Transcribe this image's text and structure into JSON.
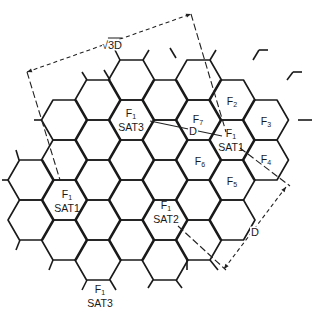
{
  "diagram": {
    "grid": {
      "origin_x": 198.5,
      "origin_y": 80,
      "col_spacing": 33.5,
      "row_spacing": 40,
      "side": 23,
      "cells": [
        {
          "k": -5,
          "y": 180
        },
        {
          "k": -5,
          "y": 220
        },
        {
          "k": -4,
          "y": 120
        },
        {
          "k": -4,
          "y": 160
        },
        {
          "k": -4,
          "y": 200
        },
        {
          "k": -4,
          "y": 240
        },
        {
          "k": -3,
          "y": 100
        },
        {
          "k": -3,
          "y": 140
        },
        {
          "k": -3,
          "y": 180
        },
        {
          "k": -3,
          "y": 220
        },
        {
          "k": -3,
          "y": 260
        },
        {
          "k": -2,
          "y": 80
        },
        {
          "k": -2,
          "y": 120
        },
        {
          "k": -2,
          "y": 160
        },
        {
          "k": -2,
          "y": 200
        },
        {
          "k": -2,
          "y": 240
        },
        {
          "k": -1,
          "y": 100
        },
        {
          "k": -1,
          "y": 140
        },
        {
          "k": -1,
          "y": 180
        },
        {
          "k": -1,
          "y": 220
        },
        {
          "k": -1,
          "y": 260
        },
        {
          "k": 0,
          "y": 80
        },
        {
          "k": 0,
          "y": 120
        },
        {
          "k": 0,
          "y": 160
        },
        {
          "k": 0,
          "y": 200
        },
        {
          "k": 0,
          "y": 240
        },
        {
          "k": 1,
          "y": 100
        },
        {
          "k": 1,
          "y": 140
        },
        {
          "k": 1,
          "y": 180
        },
        {
          "k": 1,
          "y": 220
        },
        {
          "k": 2,
          "y": 120
        },
        {
          "k": 2,
          "y": 160
        }
      ],
      "stubs": [
        [
          176,
          58,
          170,
          48
        ],
        [
          210,
          60,
          216,
          50
        ],
        [
          143,
          60,
          149,
          50
        ],
        [
          120,
          60,
          115,
          50
        ],
        [
          110,
          80,
          104,
          70
        ],
        [
          87,
          80,
          82,
          72
        ],
        [
          253,
          60,
          259,
          50
        ],
        [
          259,
          50,
          268,
          50
        ],
        [
          287,
          80,
          293,
          72
        ],
        [
          293,
          72,
          302,
          72
        ],
        [
          298,
          120,
          312,
          120
        ],
        [
          42,
          120,
          34,
          120
        ],
        [
          8,
          180,
          2,
          180
        ],
        [
          19,
          160,
          16,
          150
        ],
        [
          20,
          240,
          16,
          250
        ],
        [
          53,
          260,
          49,
          270
        ],
        [
          87,
          280,
          82,
          290
        ],
        [
          110,
          280,
          116,
          290
        ],
        [
          153,
          280,
          148,
          288
        ],
        [
          176,
          280,
          182,
          288
        ],
        [
          187,
          260,
          187,
          270
        ],
        [
          210,
          260,
          218,
          270
        ]
      ]
    },
    "cell_labels": [
      {
        "id": "f1-sat3-upper",
        "freq": "F",
        "sub": "1",
        "sat": "SAT3",
        "x": 131,
        "y": 120
      },
      {
        "id": "f7",
        "freq": "F",
        "sub": "7",
        "sat": "",
        "x": 198,
        "y": 120
      },
      {
        "id": "f2",
        "freq": "F",
        "sub": "2",
        "sat": "",
        "x": 232,
        "y": 102
      },
      {
        "id": "f3",
        "freq": "F",
        "sub": "3",
        "sat": "",
        "x": 266,
        "y": 122
      },
      {
        "id": "f1-sat1-right",
        "freq": "F",
        "sub": "1",
        "sat": "SAT1",
        "x": 231,
        "y": 140
      },
      {
        "id": "f4",
        "freq": "F",
        "sub": "4",
        "sat": "",
        "x": 266,
        "y": 160
      },
      {
        "id": "f6",
        "freq": "F",
        "sub": "6",
        "sat": "",
        "x": 200,
        "y": 162
      },
      {
        "id": "f5",
        "freq": "F",
        "sub": "5",
        "sat": "",
        "x": 232,
        "y": 182
      },
      {
        "id": "f1-sat1-left",
        "freq": "F",
        "sub": "1",
        "sat": "SAT1",
        "x": 67,
        "y": 201
      },
      {
        "id": "f1-sat2",
        "freq": "F",
        "sub": "1",
        "sat": "SAT2",
        "x": 166,
        "y": 212
      },
      {
        "id": "f1-sat3-lower",
        "freq": "F",
        "sub": "1",
        "sat": "SAT3",
        "x": 100,
        "y": 296
      }
    ],
    "dimensions": {
      "sqrt3d": {
        "radical": "√",
        "label": "3D",
        "x": 112,
        "y": 45
      },
      "d_center": {
        "label": "D",
        "x": 193,
        "y": 131
      },
      "d_side": {
        "label": "D",
        "x": 255,
        "y": 232
      }
    },
    "lines": {
      "sqrt3d_top": [
        27,
        72,
        191,
        14
      ],
      "sqrt3d_left_ext": [
        27,
        72,
        60,
        180
      ],
      "sqrt3d_right_ext": [
        191,
        14,
        226,
        132
      ],
      "d_center_line": [
        150,
        121,
        222,
        136
      ],
      "d_side_ext_top": [
        240,
        148,
        290,
        186
      ],
      "d_side_ext_bottom": [
        178,
        226,
        226,
        270
      ],
      "d_side_dim": [
        286,
        187,
        224,
        269
      ]
    }
  }
}
